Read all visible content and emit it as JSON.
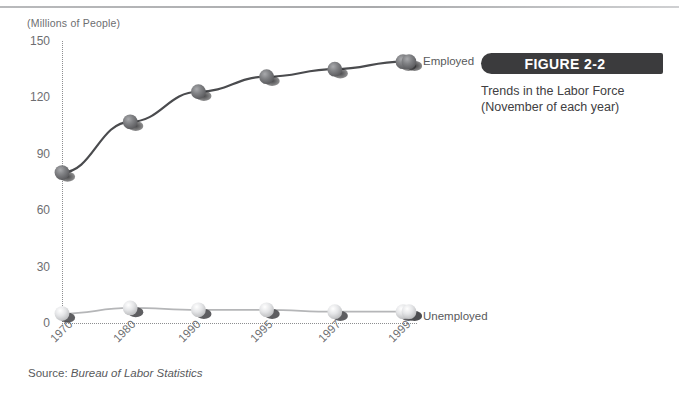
{
  "figure": {
    "badge_label": "FIGURE 2-2",
    "caption_line_1": "Trends in the Labor Force",
    "caption_line_2": "(November of each year)",
    "badge_color": "#3b3b3d"
  },
  "source": {
    "prefix": "Source:",
    "body": "Bureau of Labor Statistics"
  },
  "chart_data": {
    "type": "line",
    "title": "Trends in the Labor Force",
    "subtitle": "(November of each year)",
    "xlabel": "",
    "ylabel": "(Millions of People)",
    "categories": [
      "1970",
      "1980",
      "1990",
      "1995",
      "1997",
      "1999"
    ],
    "x": [
      1970,
      1980,
      1990,
      1995,
      1997,
      1999
    ],
    "ylim": [
      0,
      150
    ],
    "yticks": [
      0,
      30,
      60,
      90,
      120,
      150
    ],
    "ytick_labels": [
      "0",
      "30",
      "60",
      "90",
      "120",
      "150"
    ],
    "grid": false,
    "legend": "inline-end-of-line",
    "series": [
      {
        "name": "Employed",
        "values": [
          80,
          107,
          123,
          131,
          135,
          139
        ],
        "marker_color": "#6f7073",
        "line_color": "#4a4b4e"
      },
      {
        "name": "Unemployed",
        "values": [
          5,
          8,
          7,
          7,
          6,
          6
        ],
        "marker_color": "#e2e3e5",
        "line_color": "#b5b6b8"
      }
    ]
  }
}
